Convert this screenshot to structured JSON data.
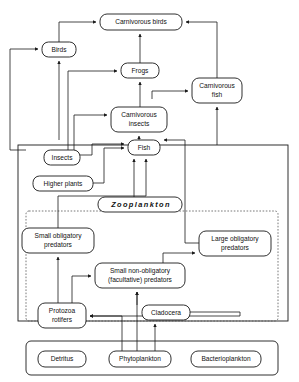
{
  "diagram": {
    "style": {
      "line_color": "#1a1a1a",
      "box_fill": "#ffffff",
      "background": "#ffffff"
    },
    "nodes": [
      {
        "id": "carnivorous-birds",
        "label": "Carnivorous birds",
        "x": 100,
        "y": 14,
        "w": 82,
        "h": 16,
        "lines": [
          "Carnivorous birds"
        ]
      },
      {
        "id": "birds",
        "label": "Birds",
        "x": 42,
        "y": 42,
        "w": 34,
        "h": 15,
        "lines": [
          "Birds"
        ]
      },
      {
        "id": "frogs",
        "label": "Frogs",
        "x": 121,
        "y": 63,
        "w": 38,
        "h": 15,
        "lines": [
          "Frogs"
        ]
      },
      {
        "id": "carnivorous-fish",
        "label": "Carnivorous fish",
        "x": 192,
        "y": 78,
        "w": 50,
        "h": 25,
        "lines": [
          "Carnivorous",
          "fish"
        ]
      },
      {
        "id": "carnivorous-insects",
        "label": "Carnivorous insects",
        "x": 111,
        "y": 107,
        "w": 56,
        "h": 25,
        "lines": [
          "Carnivorous",
          "insects"
        ]
      },
      {
        "id": "fish",
        "label": "Fish",
        "x": 128,
        "y": 140,
        "w": 32,
        "h": 15,
        "lines": [
          "Fish"
        ]
      },
      {
        "id": "insects",
        "label": "Insects",
        "x": 44,
        "y": 150,
        "w": 36,
        "h": 15,
        "lines": [
          "Insects"
        ]
      },
      {
        "id": "higher-plants",
        "label": "Higher plants",
        "x": 33,
        "y": 176,
        "w": 60,
        "h": 15,
        "lines": [
          "Higher plants"
        ]
      },
      {
        "id": "zooplankton",
        "label": "Zooplankton",
        "x": 98,
        "y": 204,
        "w": 84,
        "h": 15,
        "lines": [
          "Zooplankton"
        ]
      },
      {
        "id": "small-obligatory-predators",
        "label": "Small obligatory predators",
        "x": 22,
        "y": 228,
        "w": 72,
        "h": 25,
        "lines": [
          "Small obligatory",
          "predators"
        ]
      },
      {
        "id": "large-obligatory-predators",
        "label": "Large obligatory predators",
        "x": 199,
        "y": 231,
        "w": 72,
        "h": 25,
        "lines": [
          "Large obligatory",
          "predators"
        ]
      },
      {
        "id": "small-non-obligatory-predators",
        "label": "Small non-obligatory (facultative) predators",
        "x": 95,
        "y": 263,
        "w": 90,
        "h": 25,
        "lines": [
          "Small non-obligatory",
          "(facultative) predators"
        ]
      },
      {
        "id": "protozoa-rotifers",
        "label": "Protozoa rotifers",
        "x": 38,
        "y": 303,
        "w": 48,
        "h": 25,
        "lines": [
          "Protozoa",
          "rotifers"
        ]
      },
      {
        "id": "cladocera",
        "label": "Cladocera",
        "x": 142,
        "y": 305,
        "w": 48,
        "h": 15,
        "lines": [
          "Cladocera"
        ]
      },
      {
        "id": "detritus",
        "label": "Detritus",
        "x": 38,
        "y": 352,
        "w": 48,
        "h": 16,
        "lines": [
          "Detritus"
        ]
      },
      {
        "id": "phytoplankton",
        "label": "Phytoplankton",
        "x": 109,
        "y": 352,
        "w": 62,
        "h": 16,
        "lines": [
          "Phytoplankton"
        ]
      },
      {
        "id": "bacterioplankton",
        "label": "Bacterioplankton",
        "x": 198,
        "y": 352,
        "w": 70,
        "h": 16,
        "lines": [
          "Bacterioplankton"
        ]
      }
    ],
    "frames": [
      {
        "id": "pond-frame",
        "style": "solid",
        "x": 18,
        "y": 145,
        "w": 270,
        "h": 176
      },
      {
        "id": "zooplankton-frame",
        "style": "dotted",
        "x": 26,
        "y": 211,
        "w": 252,
        "h": 110
      },
      {
        "id": "basal-resources-frame",
        "style": "solid",
        "x": 26,
        "y": 341,
        "w": 252,
        "h": 34
      }
    ],
    "edges": [
      {
        "from": "birds",
        "to": "carnivorous-birds"
      },
      {
        "from": "frogs",
        "to": "carnivorous-birds"
      },
      {
        "from": "carnivorous-fish",
        "to": "carnivorous-birds"
      },
      {
        "from": "insects",
        "to": "birds"
      },
      {
        "from": "fish",
        "to": "birds"
      },
      {
        "from": "carnivorous-insects",
        "to": "frogs"
      },
      {
        "from": "insects",
        "to": "frogs"
      },
      {
        "from": "carnivorous-insects",
        "to": "carnivorous-fish"
      },
      {
        "from": "fish",
        "to": "carnivorous-fish"
      },
      {
        "from": "insects",
        "to": "carnivorous-insects"
      },
      {
        "from": "fish",
        "to": "carnivorous-insects"
      },
      {
        "from": "insects",
        "to": "fish"
      },
      {
        "from": "higher-plants",
        "to": "fish"
      },
      {
        "from": "zooplankton",
        "to": "fish"
      },
      {
        "from": "large-obligatory-predators",
        "to": "fish"
      },
      {
        "from": "small-obligatory-predators",
        "to": "fish"
      },
      {
        "from": "protozoa-rotifers",
        "to": "small-obligatory-predators"
      },
      {
        "from": "protozoa-rotifers",
        "to": "small-non-obligatory-predators"
      },
      {
        "from": "cladocera",
        "to": "small-non-obligatory-predators"
      },
      {
        "from": "small-non-obligatory-predators",
        "to": "large-obligatory-predators"
      },
      {
        "from": "cladocera",
        "to": "protozoa-rotifers"
      },
      {
        "from": "phytoplankton",
        "to": "protozoa-rotifers"
      },
      {
        "from": "phytoplankton",
        "to": "cladocera"
      },
      {
        "from": "phytoplankton",
        "to": "small-non-obligatory-predators"
      }
    ]
  }
}
